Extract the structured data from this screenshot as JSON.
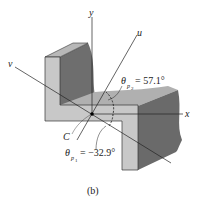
{
  "figure": {
    "caption": "(b)"
  },
  "axes": {
    "x_label": "x",
    "y_label": "y",
    "u_label": "u",
    "v_label": "v"
  },
  "centroid": {
    "label": "C"
  },
  "angles": {
    "theta_p2": {
      "symbol": "θ",
      "sub_main": "p",
      "sub_index": "2",
      "value_text": "= 57.1°",
      "value_deg": 57.1
    },
    "theta_p1": {
      "symbol": "θ",
      "sub_main": "p",
      "sub_index": "1",
      "value_text": "= −32.9°",
      "value_deg": -32.9
    }
  },
  "colors": {
    "front_face": "#c8c8c8",
    "top_face": "#b4b4b4",
    "side_face": "#6e6e6e",
    "line": "#222222"
  }
}
